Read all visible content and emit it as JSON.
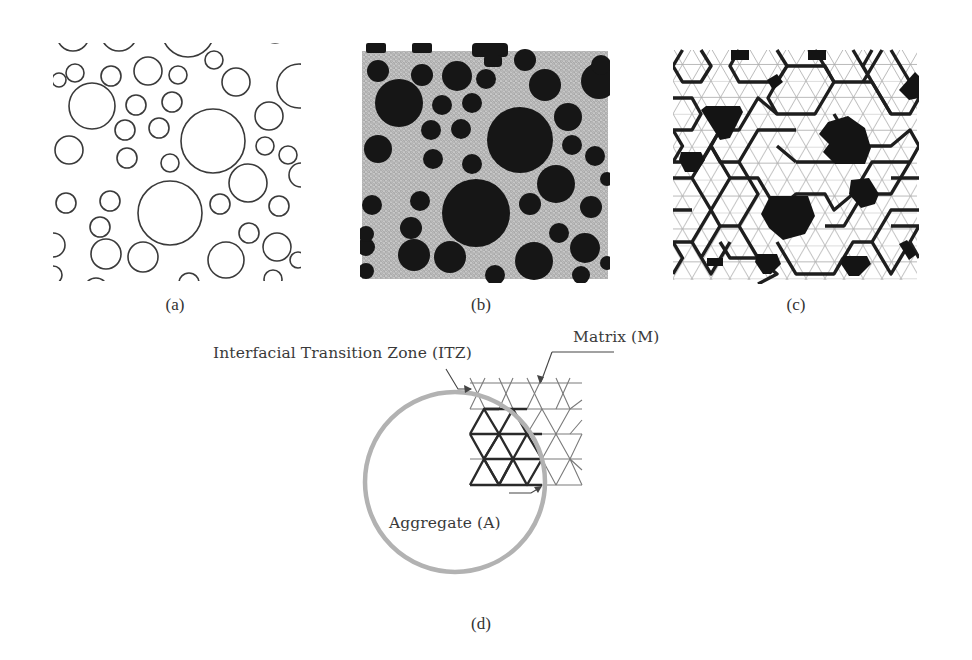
{
  "figure": {
    "panels": [
      {
        "id": "a",
        "caption": "(a)",
        "description": "Random circular aggregate particles (outlines)"
      },
      {
        "id": "b",
        "caption": "(b)",
        "description": "Aggregates mapped onto fine triangular lattice mesh"
      },
      {
        "id": "c",
        "caption": "(c)",
        "description": "Coarse triangular lattice with aggregate, matrix and ITZ elements"
      },
      {
        "id": "d",
        "caption": "(d)",
        "description": "Detail of lattice elements near an aggregate"
      }
    ],
    "labels": {
      "itz": "Interfacial Transition Zone (ITZ)",
      "matrix": "Matrix (M)",
      "aggregate": "Aggregate (A)"
    },
    "colors": {
      "outline": "#333333",
      "aggregate_fill": "#1a1a1a",
      "mesh_bg": "#bdbdbd",
      "itz_circle": "#b0b0b0",
      "thin_line": "#9a9a9a",
      "thick_line": "#222222"
    }
  }
}
